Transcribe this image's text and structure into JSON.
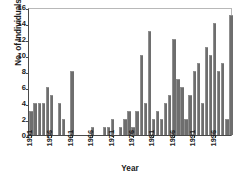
{
  "chart_data": {
    "type": "bar",
    "title": "",
    "xlabel": "Year",
    "ylabel": "No. of Individuals",
    "ylim": [
      0,
      16
    ],
    "ytick_values": [
      0,
      2,
      4,
      6,
      8,
      10,
      12,
      14,
      16
    ],
    "ytick_labels": [
      "0",
      "2",
      "4",
      "6",
      "8",
      "10",
      "12",
      "14",
      "16"
    ],
    "grid": false,
    "legend": null,
    "bar_color": "#6e6e6e",
    "xtick_labels": [
      "1951",
      "1956",
      "1961",
      "1966",
      "1971",
      "1976",
      "1981",
      "1986",
      "1991",
      "1996"
    ],
    "categories": [
      "1951",
      "1952",
      "1953",
      "1954",
      "1955",
      "1956",
      "1957",
      "1958",
      "1959",
      "1960",
      "1961",
      "1962",
      "1963",
      "1964",
      "1965",
      "1966",
      "1967",
      "1968",
      "1969",
      "1970",
      "1971",
      "1972",
      "1973",
      "1974",
      "1975",
      "1976",
      "1977",
      "1978",
      "1979",
      "1980",
      "1981",
      "1982",
      "1983",
      "1984",
      "1985",
      "1986",
      "1987",
      "1988",
      "1989",
      "1990",
      "1991",
      "1992",
      "1993",
      "1994",
      "1995",
      "1996",
      "1997",
      "1998",
      "1999",
      "2000"
    ],
    "values": [
      3,
      4,
      4,
      4,
      6,
      5,
      0,
      4,
      2,
      0,
      8,
      0,
      0,
      0,
      0,
      1,
      0,
      0,
      1,
      1,
      2,
      0,
      1,
      2,
      3,
      1,
      3,
      10,
      4,
      13,
      2,
      3,
      2,
      4,
      5,
      12,
      7,
      6,
      2,
      5,
      8,
      9,
      4,
      11,
      10,
      14,
      8,
      9,
      2,
      15
    ]
  }
}
